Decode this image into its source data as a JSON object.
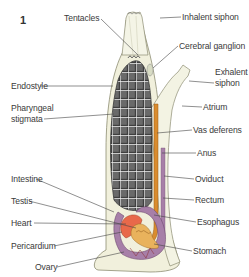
{
  "figure": {
    "number": "1"
  },
  "labels": {
    "tentacles": "Tentacles",
    "inhalent_siphon": "Inhalent siphon",
    "cerebral_ganglion": "Cerebral ganglion",
    "exhalent_siphon_1": "Exhalent",
    "exhalent_siphon_2": "siphon",
    "endostyle": "Endostyle",
    "pharyngeal_1": "Pharyngeal",
    "pharyngeal_2": "stigmata",
    "atrium": "Atrium",
    "vas_deferens": "Vas deferens",
    "anus": "Anus",
    "intestine": "Intestine",
    "oviduct": "Oviduct",
    "testis": "Testis",
    "rectum": "Rectum",
    "heart": "Heart",
    "esophagus": "Esophagus",
    "pericardium": "Pericardium",
    "stomach": "Stomach",
    "ovary": "Ovary"
  },
  "colors": {
    "tunic": "#f1f0dc",
    "tunic_outline": "#9a9a80",
    "pharynx": "#4a4a4a",
    "gut": "#a77fa8",
    "heart": "#e8694a",
    "gonad": "#e9b25c",
    "vas_deferens": "#d98c2e",
    "leader": "#444444"
  }
}
